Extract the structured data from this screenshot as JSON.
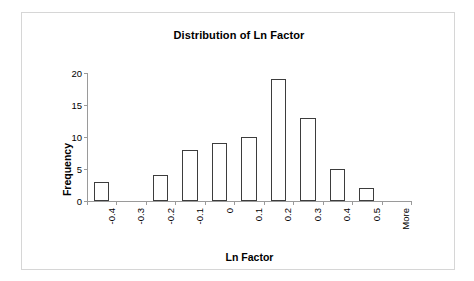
{
  "chart_data": {
    "type": "bar",
    "title": "Distribution of Ln Factor",
    "xlabel": "Ln Factor",
    "ylabel": "Frequency",
    "categories": [
      "-0.4",
      "-0.3",
      "-0.2",
      "-0.1",
      "0",
      "0.1",
      "0.2",
      "0.3",
      "0.4",
      "0.5",
      "More"
    ],
    "values": [
      3,
      0,
      4,
      8,
      9,
      10,
      19,
      13,
      5,
      2,
      0
    ],
    "ylim": [
      0,
      20
    ],
    "yticks": [
      "0",
      "5",
      "10",
      "15",
      "20"
    ],
    "ytick_values": [
      0,
      5,
      10,
      15,
      20
    ],
    "grid": false,
    "legend": false,
    "bar_fill_color": "#ffffff",
    "bar_border_color": "#3d3d3d",
    "axis_color": "#9a9a9a",
    "frame_border_color": "#d6d6d6",
    "background_color": "#ffffff",
    "xlabel_rotation": -90
  }
}
